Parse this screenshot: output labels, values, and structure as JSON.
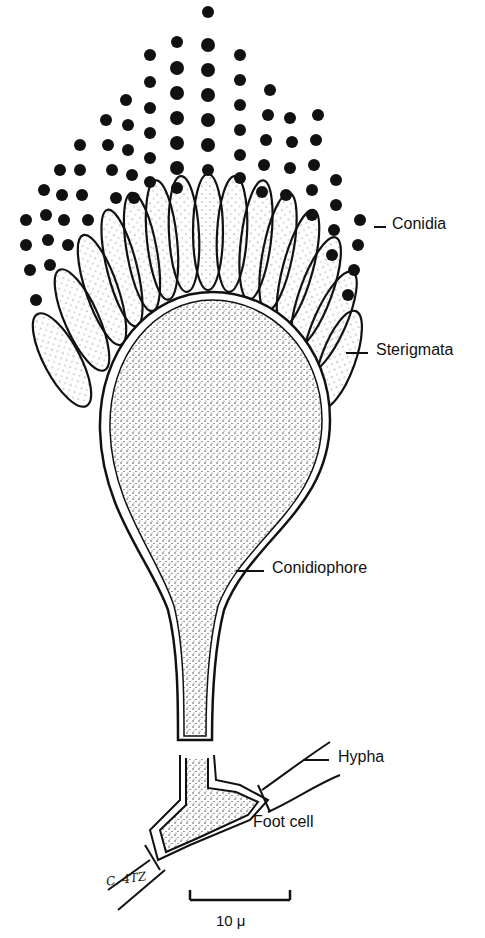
{
  "figure": {
    "labels": {
      "conidia": "Conidia",
      "sterigmata": "Sterigmata",
      "conidiophore": "Conidiophore",
      "hypha": "Hypha",
      "foot_cell": "Foot cell"
    },
    "signature": "C. 4TZ",
    "scale_bar": {
      "label": "10 μ"
    }
  }
}
